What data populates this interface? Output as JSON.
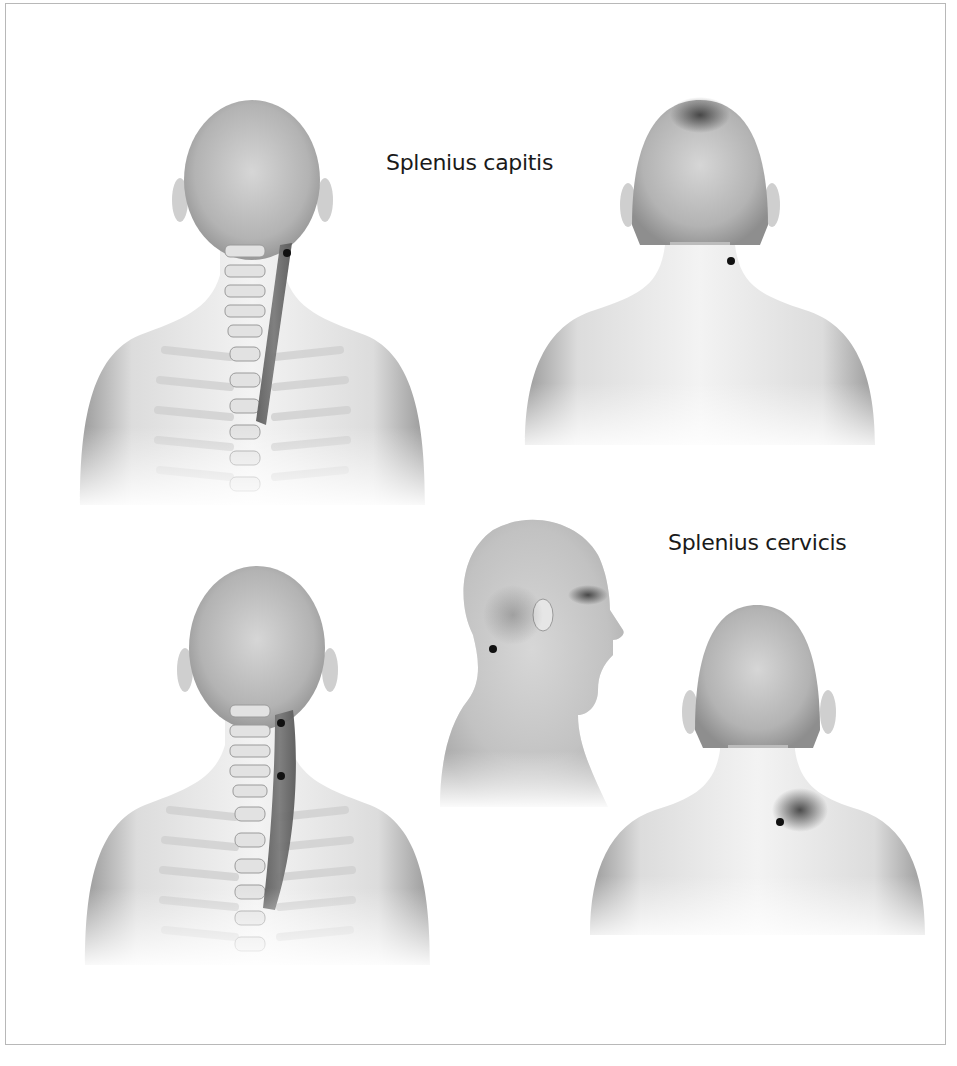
{
  "figure": {
    "labels": {
      "capitis": "Splenius capitis",
      "cervicis": "Splenius cervicis"
    },
    "colors": {
      "skin_light": "#f2f2f2",
      "skin_mid": "#c9c9c9",
      "skin_dark": "#8d8d8d",
      "muscle": "#6e6e6e",
      "bone": "#d9d9d9",
      "trigger_point": "#111111",
      "frame_border": "#b8b8b8"
    },
    "panels": [
      {
        "id": "capitis-anatomy",
        "view": "posterior",
        "trigger_points": 1,
        "muscle": "Splenius capitis"
      },
      {
        "id": "capitis-referral",
        "view": "posterior",
        "trigger_points": 1,
        "referral_zone": "vertex of head"
      },
      {
        "id": "cervicis-anatomy",
        "view": "posterior",
        "trigger_points": 2,
        "muscle": "Splenius cervicis"
      },
      {
        "id": "cervicis-referral-lateral",
        "view": "lateral",
        "trigger_points": 1,
        "referral_zone": "behind eye / occipital"
      },
      {
        "id": "cervicis-referral-posterior",
        "view": "posterior",
        "trigger_points": 1,
        "referral_zone": "neck-shoulder angle"
      }
    ]
  }
}
